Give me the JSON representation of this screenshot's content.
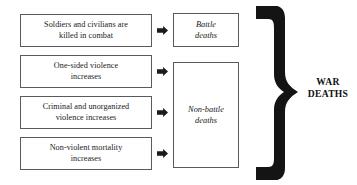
{
  "diagram": {
    "causes": [
      {
        "id": "cause-soldiers-civilians-killed",
        "line1": "Soldiers and civilians are",
        "line2": "killed in combat"
      },
      {
        "id": "cause-one-sided-violence",
        "line1": "One-sided violence",
        "line2": "increases"
      },
      {
        "id": "cause-criminal-unorganized",
        "line1": "Criminal and unorganized",
        "line2": "violence increases"
      },
      {
        "id": "cause-non-violent-mortality",
        "line1": "Non-violent mortality",
        "line2": "increases"
      }
    ],
    "arrows": [
      {
        "icon": "right-arrow-icon"
      },
      {
        "icon": "right-arrow-icon"
      },
      {
        "icon": "right-arrow-icon"
      },
      {
        "icon": "right-arrow-icon"
      }
    ],
    "categories": {
      "battle": {
        "line1": "Battle",
        "line2": "deaths"
      },
      "non_battle": {
        "line1": "Non-battle",
        "line2": "deaths"
      }
    },
    "brace": {
      "icon": "right-curly-brace-icon"
    },
    "total": {
      "line1": "WAR",
      "line2": "DEATHS"
    },
    "colors": {
      "background": "#ffffff",
      "box_border": "#5a5a5a",
      "text": "#1a1a1a",
      "arrow_fill": "#1b1b1b",
      "brace_fill": "#141414",
      "total_text": "#111111"
    }
  }
}
